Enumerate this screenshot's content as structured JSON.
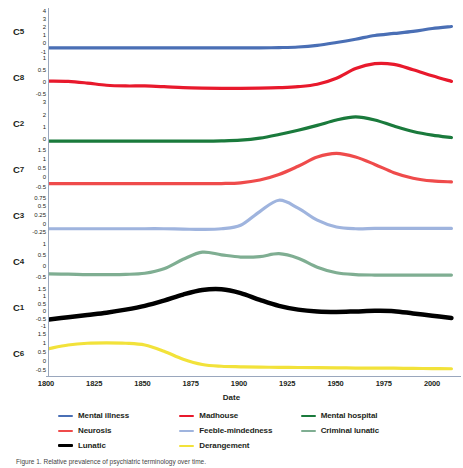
{
  "axis": {
    "xlabel": "Date",
    "xticks": [
      "1800",
      "1825",
      "1850",
      "1875",
      "1900",
      "1925",
      "1950",
      "1975",
      "2000"
    ],
    "xmin": 1800,
    "xmax": 2015
  },
  "legend": {
    "items": [
      {
        "label": "Mental illness",
        "color": "#4a6fb5"
      },
      {
        "label": "Madhouse",
        "color": "#e8192c"
      },
      {
        "label": "Mental hospital",
        "color": "#1a7a3c"
      },
      {
        "label": "Neurosis",
        "color": "#ef4b4b"
      },
      {
        "label": "Feeble-mindedness",
        "color": "#9fb4de"
      },
      {
        "label": "Criminal lunatic",
        "color": "#7fae92"
      },
      {
        "label": "Lunatic",
        "color": "#000000"
      },
      {
        "label": "Derangement",
        "color": "#f2e23a"
      }
    ]
  },
  "caption": {
    "text": "Figure 1. Relative prevalence of psychiatric terminology over time."
  },
  "chart_data": {
    "type": "line",
    "title": "",
    "xlabel": "Date",
    "ylabel": "",
    "grid": false,
    "legend_position": "bottom",
    "x": [
      1800,
      1810,
      1820,
      1830,
      1840,
      1850,
      1860,
      1870,
      1880,
      1890,
      1900,
      1910,
      1920,
      1930,
      1940,
      1950,
      1960,
      1970,
      1980,
      1990,
      2000,
      2010
    ],
    "panels": [
      {
        "id": "C5",
        "series_name": "Mental illness",
        "color": "#4a6fb5",
        "yticks": [
          4,
          3,
          2,
          1,
          0,
          -1
        ],
        "ylim": [
          -1.3,
          4.3
        ],
        "values": [
          -0.55,
          -0.55,
          -0.55,
          -0.55,
          -0.55,
          -0.55,
          -0.55,
          -0.55,
          -0.55,
          -0.55,
          -0.55,
          -0.55,
          -0.52,
          -0.45,
          -0.25,
          0.1,
          0.5,
          0.95,
          1.2,
          1.45,
          1.8,
          2.05
        ]
      },
      {
        "id": "C8",
        "series_name": "Madhouse",
        "color": "#e8192c",
        "yticks": [
          1,
          0.5,
          0,
          -0.5
        ],
        "ylim": [
          -0.75,
          1.15
        ],
        "values": [
          0.03,
          0.02,
          -0.05,
          -0.14,
          -0.17,
          -0.17,
          -0.2,
          -0.24,
          -0.26,
          -0.27,
          -0.27,
          -0.26,
          -0.24,
          -0.2,
          -0.1,
          0.15,
          0.55,
          0.75,
          0.72,
          0.5,
          0.25,
          0.02
        ]
      },
      {
        "id": "C2",
        "series_name": "Mental hospital",
        "color": "#1a7a3c",
        "yticks": [
          3,
          2,
          1,
          0
        ],
        "ylim": [
          -0.6,
          3.2
        ],
        "values": [
          -0.2,
          -0.2,
          -0.2,
          -0.2,
          -0.2,
          -0.2,
          -0.2,
          -0.2,
          -0.2,
          -0.18,
          -0.12,
          0.05,
          0.35,
          0.7,
          1.1,
          1.55,
          1.8,
          1.55,
          1.05,
          0.6,
          0.3,
          0.1
        ]
      },
      {
        "id": "C7",
        "series_name": "Neurosis",
        "color": "#ef4b4b",
        "yticks": [
          1.5,
          1,
          0.5,
          0,
          -0.5
        ],
        "ylim": [
          -0.8,
          1.7
        ],
        "values": [
          -0.35,
          -0.35,
          -0.35,
          -0.35,
          -0.35,
          -0.35,
          -0.35,
          -0.35,
          -0.35,
          -0.34,
          -0.3,
          -0.15,
          0.15,
          0.6,
          1.1,
          1.3,
          1.1,
          0.7,
          0.25,
          -0.05,
          -0.2,
          -0.25
        ]
      },
      {
        "id": "C3",
        "series_name": "Feeble-mindedness",
        "color": "#9fb4de",
        "yticks": [
          0.75,
          0.5,
          0.25,
          0,
          -0.25
        ],
        "ylim": [
          -0.42,
          0.92
        ],
        "values": [
          -0.15,
          -0.15,
          -0.15,
          -0.15,
          -0.15,
          -0.15,
          -0.15,
          -0.16,
          -0.17,
          -0.15,
          -0.05,
          0.35,
          0.68,
          0.45,
          0.1,
          -0.1,
          -0.15,
          -0.14,
          -0.14,
          -0.14,
          -0.14,
          -0.14
        ]
      },
      {
        "id": "C4",
        "series_name": "Criminal lunatic",
        "color": "#7fae92",
        "yticks": [
          1,
          0.5,
          0,
          -0.5
        ],
        "ylim": [
          -0.8,
          1.25
        ],
        "values": [
          -0.35,
          -0.36,
          -0.38,
          -0.38,
          -0.37,
          -0.32,
          -0.12,
          0.3,
          0.62,
          0.5,
          0.4,
          0.42,
          0.55,
          0.35,
          -0.05,
          -0.3,
          -0.38,
          -0.4,
          -0.4,
          -0.4,
          -0.4,
          -0.4
        ]
      },
      {
        "id": "C1",
        "series_name": "Lunatic",
        "color": "#000000",
        "yticks": [
          1.5,
          1,
          0.5,
          0,
          -0.5,
          -1
        ],
        "ylim": [
          -1.25,
          1.8
        ],
        "values": [
          -0.55,
          -0.4,
          -0.25,
          -0.1,
          0.1,
          0.35,
          0.7,
          1.1,
          1.4,
          1.45,
          1.2,
          0.75,
          0.35,
          0.1,
          -0.02,
          -0.05,
          -0.02,
          0.02,
          0.0,
          -0.15,
          -0.3,
          -0.45
        ]
      },
      {
        "id": "C6",
        "series_name": "Derangement",
        "color": "#f2e23a",
        "yticks": [
          1.5,
          1,
          0.5,
          0,
          -0.5
        ],
        "ylim": [
          -0.85,
          1.75
        ],
        "values": [
          0.7,
          0.9,
          1.0,
          1.02,
          1.0,
          0.9,
          0.55,
          0.1,
          -0.2,
          -0.3,
          -0.33,
          -0.35,
          -0.36,
          -0.37,
          -0.38,
          -0.39,
          -0.4,
          -0.4,
          -0.41,
          -0.42,
          -0.43,
          -0.44
        ]
      }
    ]
  }
}
